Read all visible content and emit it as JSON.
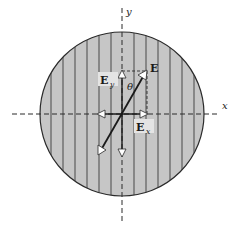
{
  "diagram": {
    "type": "polarization-vector-diagram",
    "colors": {
      "background": "#ffffff",
      "disk_fill": "#c6c6c6",
      "stroke": "#2a2a2a",
      "label_box": "#e4e4e4"
    },
    "axes": {
      "x_label": "x",
      "y_label": "y"
    },
    "vectors": {
      "E": {
        "label": "E"
      },
      "Ey": {
        "label": "E",
        "subscript": "y"
      },
      "Ex": {
        "label": "E",
        "subscript": "x"
      }
    },
    "angle": {
      "label": "θ"
    }
  }
}
